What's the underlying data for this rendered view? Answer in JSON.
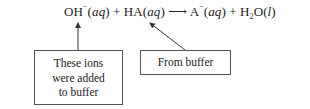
{
  "equation": {
    "reactant1": {
      "formula": "OH",
      "charge": "−",
      "state": "aq"
    },
    "plus1": "+",
    "reactant2": {
      "formula": "HA",
      "state": "aq"
    },
    "arrow": "⟶",
    "product1": {
      "formula": "A",
      "charge": "−",
      "state": "aq"
    },
    "plus2": "+",
    "product2": {
      "formula_main": "H",
      "subscript": "2",
      "formula_end": "O",
      "state": "l"
    }
  },
  "annotations": [
    {
      "lines": [
        "These ions",
        "were added",
        "to buffer"
      ],
      "points_to": "OH−(aq)"
    },
    {
      "lines": [
        "From buffer"
      ],
      "points_to": "HA(aq)"
    }
  ],
  "colors": {
    "line": "#333333",
    "box_border": "#555555",
    "text": "#222222"
  }
}
